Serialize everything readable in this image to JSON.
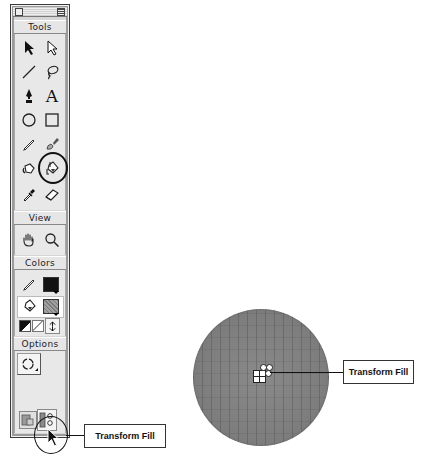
{
  "toolbox": {
    "sections": {
      "tools": "Tools",
      "view": "View",
      "colors": "Colors",
      "options": "Options"
    },
    "tools": [
      {
        "name": "arrow-tool",
        "icon": "arrow-icon"
      },
      {
        "name": "subselect-tool",
        "icon": "subselect-arrow-icon"
      },
      {
        "name": "line-tool",
        "icon": "line-icon"
      },
      {
        "name": "lasso-tool",
        "icon": "lasso-icon"
      },
      {
        "name": "pen-tool",
        "icon": "pen-icon"
      },
      {
        "name": "text-tool",
        "icon": "text-icon",
        "glyph": "A"
      },
      {
        "name": "oval-tool",
        "icon": "oval-icon"
      },
      {
        "name": "rectangle-tool",
        "icon": "rectangle-icon"
      },
      {
        "name": "pencil-tool",
        "icon": "pencil-icon"
      },
      {
        "name": "brush-tool",
        "icon": "brush-icon"
      },
      {
        "name": "ink-bottle-tool",
        "icon": "ink-bottle-icon"
      },
      {
        "name": "paint-bucket-tool",
        "icon": "paint-bucket-icon",
        "highlighted": true
      },
      {
        "name": "eyedropper-tool",
        "icon": "eyedropper-icon"
      },
      {
        "name": "eraser-tool",
        "icon": "eraser-icon"
      }
    ],
    "view_tools": [
      {
        "name": "hand-tool",
        "icon": "hand-icon"
      },
      {
        "name": "zoom-tool",
        "icon": "magnifier-icon"
      }
    ],
    "colors": {
      "stroke_color": "#111111",
      "fill_color": "#8c8c8c"
    }
  },
  "callouts": {
    "toolbox_callout": "Transform Fill",
    "canvas_callout": "Transform Fill"
  }
}
